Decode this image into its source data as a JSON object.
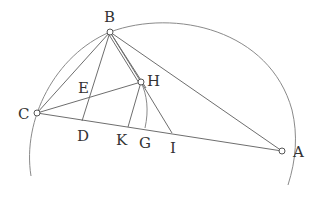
{
  "diagram": {
    "type": "geometry-figure",
    "points": {
      "A": {
        "label": "A",
        "x": 282,
        "y": 151
      },
      "B": {
        "label": "B",
        "x": 110,
        "y": 32
      },
      "C": {
        "label": "C",
        "x": 37,
        "y": 113
      },
      "H": {
        "label": "H",
        "x": 141,
        "y": 82
      },
      "E": {
        "label": "E",
        "x": 89,
        "y": 97
      },
      "D": {
        "label": "D",
        "x": 82,
        "y": 121
      },
      "K": {
        "label": "K",
        "x": 128,
        "y": 127
      },
      "G": {
        "label": "G",
        "x": 145,
        "y": 129
      },
      "I": {
        "label": "I",
        "x": 172,
        "y": 133
      }
    },
    "segments": [
      [
        "B",
        "C"
      ],
      [
        "B",
        "A"
      ],
      [
        "C",
        "A"
      ],
      [
        "B",
        "D"
      ],
      [
        "C",
        "H"
      ],
      [
        "B",
        "H"
      ],
      [
        "B",
        "K"
      ],
      [
        "H",
        "K"
      ],
      [
        "H",
        "I"
      ],
      [
        "B",
        "I"
      ]
    ],
    "arcs": [
      "circumcircle-arc through C, B, A",
      "small arc through H and G"
    ],
    "open_points": [
      "B",
      "H",
      "C",
      "A"
    ]
  }
}
